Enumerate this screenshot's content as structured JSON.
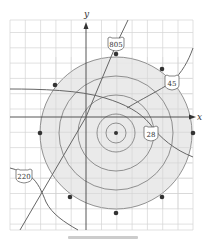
{
  "diagram": {
    "type": "coordinate-map",
    "axes": {
      "x_label": "x",
      "y_label": "y"
    },
    "grid": {
      "left": 10,
      "top": 20,
      "right": 193,
      "bottom": 230,
      "spacing": 15.3,
      "color": "#d4d4d4"
    },
    "origin_px": [
      86,
      117
    ],
    "center_px": [
      116,
      133
    ],
    "circles": {
      "fill_color": "#e6e6e6",
      "stroke_color": "#777777",
      "radii_px": [
        76,
        57,
        38,
        19,
        10
      ]
    },
    "dots": [
      [
        116,
        54
      ],
      [
        162,
        69
      ],
      [
        193,
        133
      ],
      [
        162,
        198
      ],
      [
        116,
        213
      ],
      [
        70,
        198
      ],
      [
        40,
        133
      ],
      [
        55,
        85
      ],
      [
        116,
        133
      ]
    ],
    "roads": [
      {
        "label": "805",
        "shield_px": [
          116,
          43
        ]
      },
      {
        "label": "45",
        "shield_px": [
          172,
          82
        ]
      },
      {
        "label": "28",
        "shield_px": [
          151,
          133
        ]
      },
      {
        "label": "220",
        "shield_px": [
          24,
          175
        ]
      }
    ],
    "road_color": "#666666",
    "caption": ""
  }
}
